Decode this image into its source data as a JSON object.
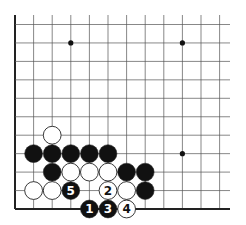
{
  "diagram": {
    "type": "go-board-fragment",
    "grid": {
      "x0": 15,
      "y0": 209,
      "dx": 18.6,
      "dy": 18.45,
      "cols": 12,
      "rows": 11,
      "right_extent": 230,
      "top_extent": 15,
      "line_color": "#555555",
      "edge_color": "#222222"
    },
    "star_points": [
      {
        "col": 3,
        "row": 9
      },
      {
        "col": 9,
        "row": 9
      },
      {
        "col": 9,
        "row": 3
      }
    ],
    "stones": [
      {
        "col": 2,
        "row": 4,
        "color": "white",
        "label": ""
      },
      {
        "col": 1,
        "row": 3,
        "color": "black",
        "label": ""
      },
      {
        "col": 2,
        "row": 3,
        "color": "black",
        "label": ""
      },
      {
        "col": 3,
        "row": 3,
        "color": "black",
        "label": ""
      },
      {
        "col": 4,
        "row": 3,
        "color": "black",
        "label": ""
      },
      {
        "col": 5,
        "row": 3,
        "color": "black",
        "label": ""
      },
      {
        "col": 2,
        "row": 2,
        "color": "black",
        "label": ""
      },
      {
        "col": 3,
        "row": 2,
        "color": "white",
        "label": ""
      },
      {
        "col": 4,
        "row": 2,
        "color": "white",
        "label": ""
      },
      {
        "col": 5,
        "row": 2,
        "color": "white",
        "label": ""
      },
      {
        "col": 6,
        "row": 2,
        "color": "black",
        "label": ""
      },
      {
        "col": 7,
        "row": 2,
        "color": "black",
        "label": ""
      },
      {
        "col": 1,
        "row": 1,
        "color": "white",
        "label": ""
      },
      {
        "col": 2,
        "row": 1,
        "color": "white",
        "label": ""
      },
      {
        "col": 3,
        "row": 1,
        "color": "black",
        "label": "5"
      },
      {
        "col": 5,
        "row": 1,
        "color": "white",
        "label": "2"
      },
      {
        "col": 6,
        "row": 1,
        "color": "white",
        "label": ""
      },
      {
        "col": 7,
        "row": 1,
        "color": "black",
        "label": ""
      },
      {
        "col": 4,
        "row": 0,
        "color": "black",
        "label": "1"
      },
      {
        "col": 5,
        "row": 0,
        "color": "black",
        "label": "3"
      },
      {
        "col": 6,
        "row": 0,
        "color": "white",
        "label": "4"
      }
    ],
    "colors": {
      "black_stone": "#111111",
      "white_stone": "#ffffff",
      "stone_outline": "#222222"
    }
  }
}
